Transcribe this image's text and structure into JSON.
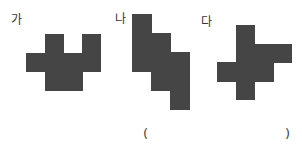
{
  "figures": [
    {
      "label": "가",
      "label_pos": [
        11,
        14
      ],
      "origin": [
        26,
        34
      ],
      "cell": 18.6,
      "cells": [
        [
          1,
          0
        ],
        [
          3,
          0
        ],
        [
          0,
          1
        ],
        [
          1,
          1
        ],
        [
          2,
          1
        ],
        [
          3,
          1
        ],
        [
          1,
          2
        ],
        [
          2,
          2
        ]
      ]
    },
    {
      "label": "나",
      "label_pos": [
        115,
        13
      ],
      "origin": [
        132,
        14
      ],
      "cell": 19,
      "cells": [
        [
          0,
          0
        ],
        [
          0,
          1
        ],
        [
          1,
          1
        ],
        [
          0,
          2
        ],
        [
          1,
          2
        ],
        [
          2,
          2
        ],
        [
          1,
          3
        ],
        [
          2,
          3
        ],
        [
          2,
          4
        ]
      ]
    },
    {
      "label": "다",
      "label_pos": [
        201,
        16
      ],
      "origin": [
        217,
        25
      ],
      "cell": 18.6,
      "cells": [
        [
          1,
          0
        ],
        [
          1,
          1
        ],
        [
          2,
          1
        ],
        [
          3,
          1
        ],
        [
          0,
          2
        ],
        [
          1,
          2
        ],
        [
          2,
          2
        ],
        [
          1,
          3
        ]
      ]
    }
  ],
  "answer": {
    "open_paren": "(",
    "close_paren": ")",
    "value": ""
  },
  "colors": {
    "shape_fill": "#454545",
    "text": "#333333",
    "background": "#ffffff"
  }
}
